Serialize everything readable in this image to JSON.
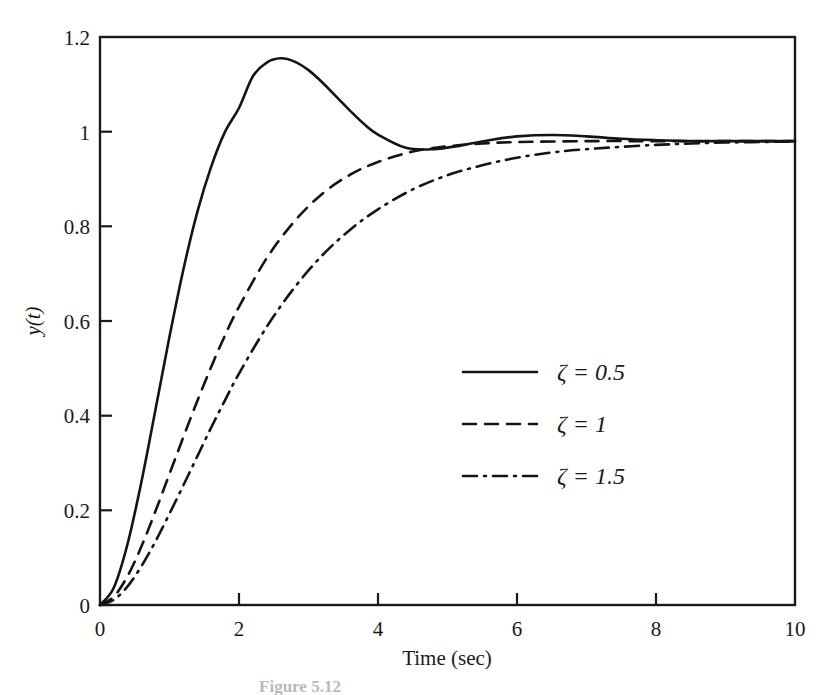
{
  "figure": {
    "caption": "Figure 5.12",
    "background_color": "#ffffff",
    "ink_color": "#1a1a1a"
  },
  "chart_data": {
    "type": "line",
    "title": "",
    "xlabel": "Time (sec)",
    "ylabel": "y(t)",
    "xlim": [
      0,
      10
    ],
    "ylim": [
      0,
      1.2
    ],
    "xticks": [
      0,
      2,
      4,
      6,
      8,
      10
    ],
    "xtick_labels": [
      "0",
      "2",
      "4",
      "6",
      "8",
      "10"
    ],
    "yticks": [
      0,
      0.2,
      0.4,
      0.6,
      0.8,
      1,
      1.2
    ],
    "ytick_labels": [
      "0",
      "0.2",
      "0.4",
      "0.6",
      "0.8",
      "1",
      "1.2"
    ],
    "grid": false,
    "legend_position": "center-right",
    "steady_state": 0.98,
    "series": [
      {
        "name": "zeta = 0.5",
        "legend_symbol": "ζ",
        "legend_relation": "=",
        "legend_value": "0.5",
        "legend_label": "ζ  = 0.5",
        "style": "solid",
        "color": "#141414",
        "peak_value": 1.16,
        "peak_time": 1.95,
        "undershoot_value": 0.963,
        "undershoot_time": 3.85,
        "x": [
          0,
          0.2,
          0.4,
          0.6,
          0.8,
          1.0,
          1.2,
          1.4,
          1.6,
          1.8,
          2.0,
          2.2,
          2.4,
          2.6,
          2.8,
          3.0,
          3.2,
          3.4,
          3.6,
          3.8,
          4.0,
          4.4,
          4.8,
          5.2,
          5.6,
          6.0,
          6.5,
          7.0,
          7.5,
          8.0,
          8.5,
          9.0,
          9.5,
          10.0
        ],
        "y": [
          0,
          0.037,
          0.131,
          0.263,
          0.414,
          0.567,
          0.709,
          0.83,
          0.926,
          1.0,
          1.05,
          1.117,
          1.146,
          1.155,
          1.148,
          1.13,
          1.104,
          1.074,
          1.044,
          1.016,
          0.994,
          0.966,
          0.963,
          0.971,
          0.982,
          0.99,
          0.993,
          0.99,
          0.985,
          0.982,
          0.98,
          0.98,
          0.98,
          0.98
        ]
      },
      {
        "name": "zeta = 1",
        "legend_symbol": "ζ",
        "legend_relation": "=",
        "legend_value": "1",
        "legend_label": "ζ  = 1",
        "style": "dashed",
        "color": "#141414",
        "peak_value": 0.98,
        "peak_time": 10,
        "x": [
          0,
          0.2,
          0.4,
          0.6,
          0.8,
          1.0,
          1.2,
          1.4,
          1.6,
          1.8,
          2.0,
          2.4,
          2.8,
          3.2,
          3.6,
          4.0,
          4.5,
          5.0,
          5.5,
          6.0,
          7.0,
          8.0,
          9.0,
          10.0
        ],
        "y": [
          0,
          0.018,
          0.062,
          0.125,
          0.199,
          0.277,
          0.355,
          0.431,
          0.503,
          0.57,
          0.63,
          0.733,
          0.811,
          0.869,
          0.909,
          0.936,
          0.958,
          0.969,
          0.975,
          0.978,
          0.98,
          0.98,
          0.98,
          0.98
        ]
      },
      {
        "name": "zeta = 1.5",
        "legend_symbol": "ζ",
        "legend_relation": "=",
        "legend_value": "1.5",
        "legend_label": "ζ  = 1.5",
        "style": "dashdot",
        "color": "#141414",
        "peak_value": 0.98,
        "peak_time": 10,
        "x": [
          0,
          0.2,
          0.4,
          0.6,
          0.8,
          1.0,
          1.2,
          1.4,
          1.6,
          1.8,
          2.0,
          2.4,
          2.8,
          3.2,
          3.6,
          4.0,
          4.5,
          5.0,
          5.5,
          6.0,
          6.5,
          7.0,
          8.0,
          9.0,
          10.0
        ],
        "y": [
          0,
          0.011,
          0.04,
          0.083,
          0.135,
          0.193,
          0.253,
          0.314,
          0.375,
          0.433,
          0.489,
          0.588,
          0.671,
          0.739,
          0.793,
          0.836,
          0.878,
          0.908,
          0.929,
          0.945,
          0.956,
          0.963,
          0.972,
          0.977,
          0.979
        ]
      }
    ]
  },
  "legend": {
    "items": [
      {
        "label": "ζ  = 0.5",
        "style": "solid"
      },
      {
        "label": "ζ  = 1",
        "style": "dashed"
      },
      {
        "label": "ζ  = 1.5",
        "style": "dashdot"
      }
    ]
  }
}
